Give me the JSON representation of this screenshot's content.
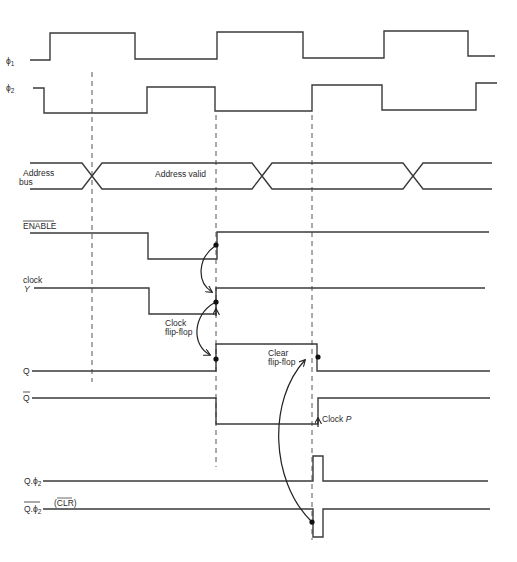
{
  "signals": [
    {
      "id": "phi1",
      "label": "ϕ1",
      "label_main": "ϕ",
      "label_sub": "1"
    },
    {
      "id": "phi2",
      "label": "ϕ2",
      "label_main": "ϕ",
      "label_sub": "2"
    },
    {
      "id": "address_bus",
      "label_line1": "Address",
      "label_line2": "bus",
      "state_text": "Address valid"
    },
    {
      "id": "enable",
      "label": "ENABLE",
      "overbar": true
    },
    {
      "id": "clock_y",
      "label_line1": "clock",
      "label_line2": "Y"
    },
    {
      "id": "q",
      "label": "Q"
    },
    {
      "id": "q_bar",
      "label": "Q",
      "overbar": true
    },
    {
      "id": "q_phi2",
      "label_main": "Q.ϕ",
      "label_sub": "2"
    },
    {
      "id": "q_phi2_bar",
      "label_main": "Q.ϕ",
      "label_sub": "2",
      "overbar": true,
      "alias": "(CLR)",
      "alias_overbar_text": "CLR"
    }
  ],
  "annotations": {
    "clock_flip_flop_line1": "Clock",
    "clock_flip_flop_line2": "flip-flop",
    "clear_flip_flop_line1": "Clear",
    "clear_flip_flop_line2": "flip-flop",
    "clock_p_prefix": "Clock ",
    "clock_p_letter": "P"
  },
  "waveforms": {
    "phi1": [
      [
        30,
        60
      ],
      [
        50,
        60
      ],
      [
        50,
        33
      ],
      [
        135,
        33
      ],
      [
        135,
        59
      ],
      [
        217,
        59
      ],
      [
        217,
        32
      ],
      [
        303,
        32
      ],
      [
        303,
        58
      ],
      [
        384,
        58
      ],
      [
        384,
        31
      ],
      [
        468,
        31
      ],
      [
        468,
        56
      ],
      [
        495,
        56
      ]
    ],
    "phi2": [
      [
        33,
        88
      ],
      [
        44,
        88
      ],
      [
        44,
        113
      ],
      [
        147,
        113
      ],
      [
        147,
        87
      ],
      [
        215,
        87
      ],
      [
        215,
        111
      ],
      [
        312,
        111
      ],
      [
        312,
        85
      ],
      [
        382,
        85
      ],
      [
        382,
        110
      ],
      [
        476,
        110
      ],
      [
        476,
        83
      ],
      [
        497,
        83
      ]
    ],
    "enable": [
      [
        30,
        233
      ],
      [
        148,
        233
      ],
      [
        148,
        259
      ],
      [
        217,
        259
      ],
      [
        217,
        232
      ],
      [
        489,
        232
      ]
    ],
    "clock_y": [
      [
        34,
        288
      ],
      [
        149,
        288
      ],
      [
        149,
        314
      ],
      [
        216,
        314
      ],
      [
        216,
        288
      ],
      [
        485,
        288
      ]
    ],
    "q": [
      [
        32,
        371
      ],
      [
        216,
        371
      ],
      [
        216,
        344
      ],
      [
        317,
        344
      ],
      [
        317,
        371
      ],
      [
        490,
        371
      ]
    ],
    "q_bar": [
      [
        32,
        398
      ],
      [
        216,
        398
      ],
      [
        216,
        424
      ],
      [
        318,
        424
      ],
      [
        318,
        398
      ],
      [
        490,
        398
      ]
    ],
    "q_phi2": [
      [
        43,
        481
      ],
      [
        313,
        481
      ],
      [
        313,
        456
      ],
      [
        323,
        456
      ],
      [
        323,
        481
      ],
      [
        488,
        481
      ]
    ],
    "q_phi2_bar": [
      [
        43,
        509
      ],
      [
        313,
        509
      ],
      [
        313,
        537
      ],
      [
        323,
        537
      ],
      [
        323,
        509
      ],
      [
        490,
        509
      ]
    ]
  },
  "address_bus": {
    "top_y": 163,
    "bottom_y": 189,
    "start_x": 30,
    "end_x": 492,
    "crossings_x": [
      92,
      262,
      413
    ],
    "half_width": 10
  },
  "dashed_markers": [
    {
      "x": 92,
      "y1": 72,
      "y2": 382
    },
    {
      "x": 216,
      "y1": 115,
      "y2": 467
    },
    {
      "x": 312,
      "y1": 115,
      "y2": 540
    }
  ],
  "event_dots": [
    {
      "x": 216,
      "y": 245
    },
    {
      "x": 216,
      "y": 302
    },
    {
      "x": 216,
      "y": 359
    },
    {
      "x": 318,
      "y": 357
    },
    {
      "x": 312,
      "y": 522
    }
  ],
  "colors": {
    "background": "#ffffff",
    "line": "#3a3a3a",
    "text": "#2a2a2a"
  }
}
